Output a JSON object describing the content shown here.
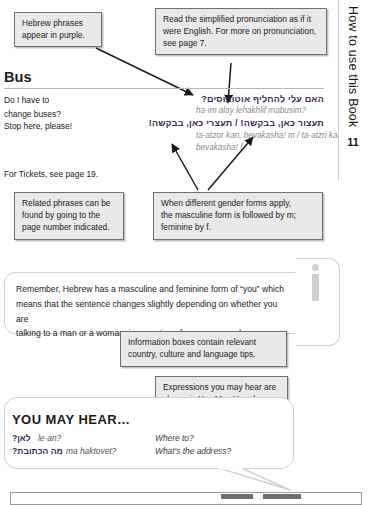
{
  "tab": {
    "label": "How to use this Book",
    "page_number": "11"
  },
  "callouts": [
    {
      "name": "callout-purple-phrases",
      "lines": [
        "Hebrew phrases",
        "appear in purple."
      ]
    },
    {
      "name": "callout-pronunciation",
      "lines": [
        "Read the simplified pronunciation as if it",
        "were English. For more on pronunciation,",
        "see page 7."
      ]
    },
    {
      "name": "callout-related-phrases",
      "lines": [
        "Related phrases can be",
        "found by going to the",
        "page number indicated."
      ]
    },
    {
      "name": "callout-gender-forms",
      "lines": [
        "When different gender forms apply,",
        "the masculine form is followed by m;",
        "feminine by f."
      ]
    },
    {
      "name": "callout-info-boxes",
      "lines": [
        "Information boxes contain relevant",
        "country, culture and language tips."
      ]
    },
    {
      "name": "callout-you-may-hear",
      "lines": [
        "Expressions you may hear are",
        "shown in You May Hear boxes."
      ]
    }
  ],
  "section": {
    "heading": "Bus",
    "entries": [
      {
        "english_line1": "Do I have to",
        "english_line2": "change buses?",
        "hebrew": "האם עלי להחליף אוטובוסים?",
        "pronunciation": "ha-im alay lehakhlif mabusim?"
      },
      {
        "english_line1": "Stop here, please!",
        "english_line2": "",
        "hebrew": "תעצור כאן, בבקשה! / תעצרי כאן, בבקשה!",
        "pronunciation_line1": "ta-atzor kan, bevakasha! m / ta-atzri kan,",
        "pronunciation_line2": "bevakasha! f"
      }
    ],
    "cross_reference": "For Tickets, see page 19."
  },
  "info_panel": {
    "icon": "info-i-icon",
    "lines": [
      "Remember, Hebrew has a masculine and feminine form of “you” which",
      "means that the sentence changes slightly depending on whether you are",
      "talking to a man or a woman, irrespective of your own gender."
    ]
  },
  "you_may_hear": {
    "title": "YOU MAY HEAR…",
    "rows": [
      {
        "hebrew": "לאן?",
        "pronunciation": "le-an?",
        "english": "Where to?"
      },
      {
        "hebrew": "מה הכתובת?",
        "pronunciation": "ma haktovet?",
        "english": "What's the address?"
      }
    ]
  },
  "colors": {
    "hebrew_purple": "#3d2a55",
    "pronunciation_gray": "#8a8a8a",
    "callout_fill": "#e9e9e9",
    "callout_border": "#6f6f6f",
    "panel_border": "#d2d2d2"
  }
}
